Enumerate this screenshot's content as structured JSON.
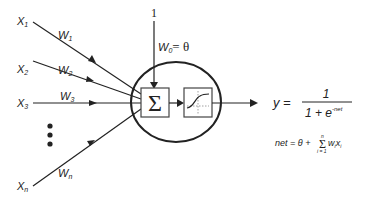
{
  "diagram": {
    "inputs": [
      {
        "label": "X",
        "sub": "1",
        "weight": "W",
        "wsub": "1"
      },
      {
        "label": "X",
        "sub": "2",
        "weight": "W",
        "wsub": "2"
      },
      {
        "label": "X",
        "sub": "3",
        "weight": "W",
        "wsub": "3"
      },
      {
        "label": "X",
        "sub": "n",
        "weight": "W",
        "wsub": "n"
      }
    ],
    "ellipsis": "⋮",
    "bias": {
      "input": "1",
      "weight_label": "W",
      "weight_sub": "0",
      "equals": "= θ"
    },
    "sum_symbol": "Σ",
    "activation": "sigmoid",
    "output": {
      "lhs": "y =",
      "numerator": "1",
      "denominator_base": "1 + e",
      "denominator_exp": "-net"
    },
    "net_formula": {
      "lhs": "net = θ +",
      "sum": "Σ",
      "upper": "n",
      "lower": "i = 1",
      "term": "w",
      "term_sub": "i",
      "term2": "x",
      "term2_sub": "i"
    },
    "colors": {
      "stroke": "#222222",
      "background": "#ffffff"
    }
  }
}
